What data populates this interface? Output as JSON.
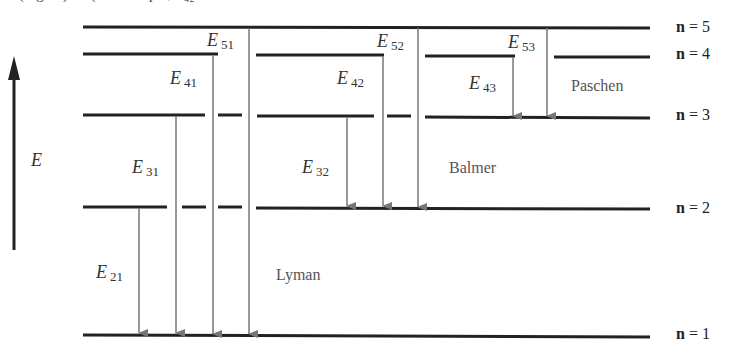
{
  "top_caption_fragment": "… (Figure) … (for example, E₄₂ …",
  "axis": {
    "label": "E",
    "direction": "up"
  },
  "levels": [
    {
      "n": 5,
      "label_prefix": "n",
      "label_value": "= 5",
      "y": 27
    },
    {
      "n": 4,
      "label_prefix": "n",
      "label_value": "= 4",
      "y": 55
    },
    {
      "n": 3,
      "label_prefix": "n",
      "label_value": "= 3",
      "y": 117
    },
    {
      "n": 2,
      "label_prefix": "n",
      "label_value": "= 2",
      "y": 208
    },
    {
      "n": 1,
      "label_prefix": "n",
      "label_value": "= 1",
      "y": 335
    }
  ],
  "series": [
    {
      "name": "Lyman",
      "final_level": 1
    },
    {
      "name": "Balmer",
      "final_level": 2
    },
    {
      "name": "Paschen",
      "final_level": 3
    }
  ],
  "transitions": [
    {
      "label": "E",
      "sub": "21",
      "from": 2,
      "to": 1,
      "x": 139
    },
    {
      "label": "E",
      "sub": "31",
      "from": 3,
      "to": 1,
      "x": 176
    },
    {
      "label": "E",
      "sub": "41",
      "from": 4,
      "to": 1,
      "x": 212
    },
    {
      "label": "E",
      "sub": "51",
      "from": 5,
      "to": 1,
      "x": 249
    },
    {
      "label": "E",
      "sub": "32",
      "from": 3,
      "to": 2,
      "x": 347
    },
    {
      "label": "E",
      "sub": "42",
      "from": 4,
      "to": 2,
      "x": 383
    },
    {
      "label": "E",
      "sub": "52",
      "from": 5,
      "to": 2,
      "x": 418
    },
    {
      "label": "E",
      "sub": "43",
      "from": 4,
      "to": 3,
      "x": 513
    },
    {
      "label": "E",
      "sub": "53",
      "from": 5,
      "to": 3,
      "x": 547
    }
  ],
  "colors": {
    "level_line": "#222222",
    "arrow": "#777777",
    "text": "#333333"
  }
}
